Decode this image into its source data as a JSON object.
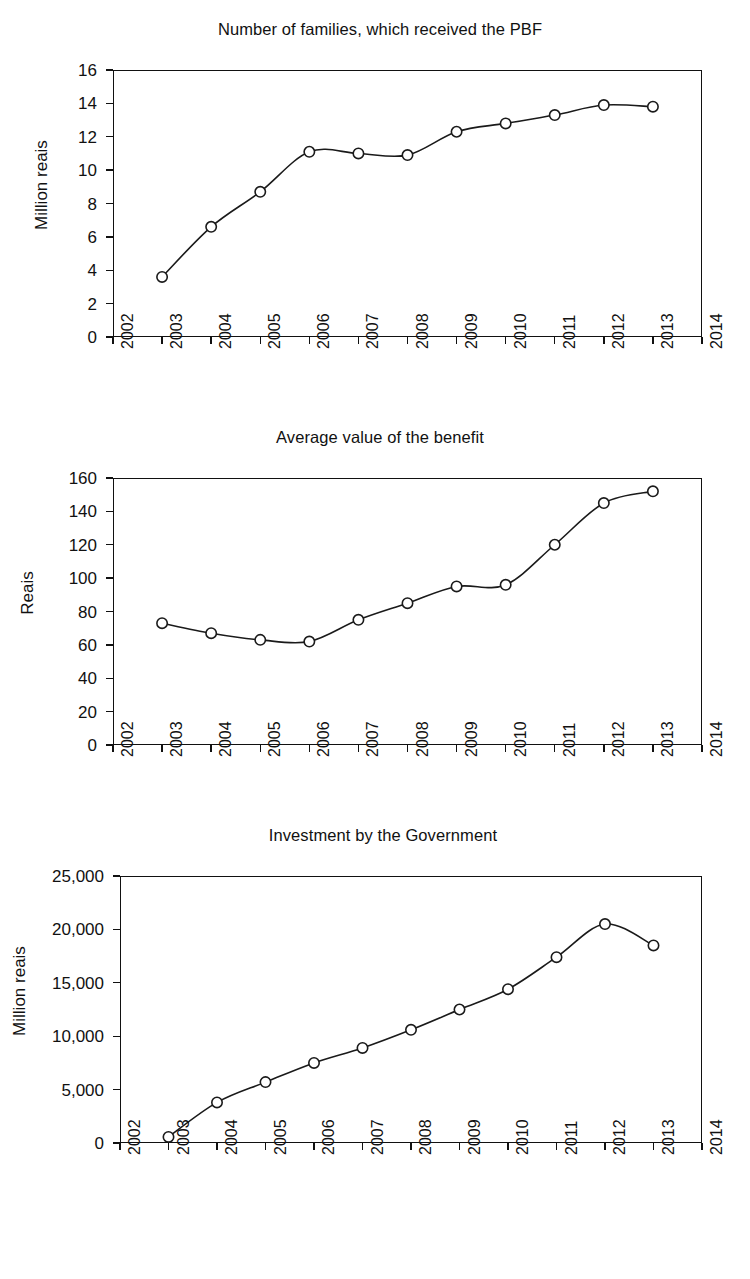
{
  "page": {
    "background": "#ffffff",
    "ink": "#1a1a1a"
  },
  "charts": [
    {
      "id": "families-pbf",
      "title": "Number of families, which received the PBF",
      "ylabel": "Million reais",
      "xlabel": "",
      "yticks": [
        "0",
        "2",
        "4",
        "6",
        "8",
        "10",
        "12",
        "14",
        "16"
      ],
      "xticks": [
        "2002",
        "2003",
        "2004",
        "2005",
        "2006",
        "2007",
        "2008",
        "2009",
        "2010",
        "2011",
        "2012",
        "2013",
        "2014"
      ]
    },
    {
      "id": "average-benefit",
      "title": "Average value of the benefit",
      "ylabel": "Reais",
      "xlabel": "",
      "yticks": [
        "0",
        "20",
        "40",
        "60",
        "80",
        "100",
        "120",
        "140",
        "160"
      ],
      "xticks": [
        "2002",
        "2003",
        "2004",
        "2005",
        "2006",
        "2007",
        "2008",
        "2009",
        "2010",
        "2011",
        "2012",
        "2013",
        "2014"
      ]
    },
    {
      "id": "government-investment",
      "title": "Investment by the Government",
      "ylabel": "Million reais",
      "xlabel": "",
      "yticks": [
        "0",
        "5,000",
        "10,000",
        "15,000",
        "20,000",
        "25,000"
      ],
      "xticks": [
        "2002",
        "2003",
        "2004",
        "2005",
        "2006",
        "2007",
        "2008",
        "2009",
        "2010",
        "2011",
        "2012",
        "2013",
        "2014"
      ]
    }
  ],
  "chart_data": [
    {
      "type": "line",
      "title": "Number of families, which received the PBF",
      "xlabel": "",
      "ylabel": "Million reais",
      "x": [
        2003,
        2004,
        2005,
        2006,
        2007,
        2008,
        2009,
        2010,
        2011,
        2012,
        2013
      ],
      "categories": [
        "2003",
        "2004",
        "2005",
        "2006",
        "2007",
        "2008",
        "2009",
        "2010",
        "2011",
        "2012",
        "2013"
      ],
      "values": [
        3.6,
        6.6,
        8.7,
        11.1,
        11.0,
        10.9,
        12.3,
        12.8,
        13.3,
        13.9,
        13.8
      ],
      "xlim": [
        2002,
        2014
      ],
      "ylim": [
        0,
        16
      ],
      "ytick_step": 2,
      "grid": false,
      "legend": false,
      "marker": "open-circle",
      "line_color": "#1a1a1a"
    },
    {
      "type": "line",
      "title": "Average value of the benefit",
      "xlabel": "",
      "ylabel": "Reais",
      "x": [
        2003,
        2004,
        2005,
        2006,
        2007,
        2008,
        2009,
        2010,
        2011,
        2012,
        2013
      ],
      "categories": [
        "2003",
        "2004",
        "2005",
        "2006",
        "2007",
        "2008",
        "2009",
        "2010",
        "2011",
        "2012",
        "2013"
      ],
      "values": [
        73,
        67,
        63,
        62,
        75,
        85,
        95,
        96,
        120,
        145,
        152
      ],
      "xlim": [
        2002,
        2014
      ],
      "ylim": [
        0,
        160
      ],
      "ytick_step": 20,
      "grid": false,
      "legend": false,
      "marker": "open-circle",
      "line_color": "#1a1a1a"
    },
    {
      "type": "line",
      "title": "Investment by the Government",
      "xlabel": "",
      "ylabel": "Million reais",
      "x": [
        2003,
        2004,
        2005,
        2006,
        2007,
        2008,
        2009,
        2010,
        2011,
        2012,
        2013
      ],
      "categories": [
        "2003",
        "2004",
        "2005",
        "2006",
        "2007",
        "2008",
        "2009",
        "2010",
        "2011",
        "2012",
        "2013"
      ],
      "values": [
        570,
        3800,
        5700,
        7500,
        8900,
        10600,
        12500,
        14400,
        17400,
        20500,
        18500
      ],
      "xlim": [
        2002,
        2014
      ],
      "ylim": [
        0,
        25000
      ],
      "ytick_step": 5000,
      "grid": false,
      "legend": false,
      "marker": "open-circle",
      "line_color": "#1a1a1a"
    }
  ]
}
